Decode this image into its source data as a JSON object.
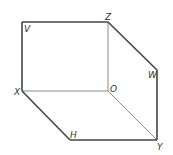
{
  "diagram": {
    "type": "cuboid-projection",
    "colors": {
      "edge": "#333333",
      "hidden_edge": "#999999",
      "label": "#333333",
      "background": "#ffffff"
    },
    "points": {
      "V": {
        "x": 22,
        "y": 22
      },
      "Z": {
        "x": 108,
        "y": 22
      },
      "W": {
        "x": 157,
        "y": 70
      },
      "X": {
        "x": 22,
        "y": 91
      },
      "O": {
        "x": 108,
        "y": 91
      },
      "H": {
        "x": 70,
        "y": 140
      },
      "Y": {
        "x": 157,
        "y": 140
      }
    },
    "labels": {
      "V": "V",
      "Z": "Z",
      "W": "W",
      "X": "X",
      "O": "O",
      "H": "H",
      "Y": "Y"
    },
    "edges": [
      {
        "from": "V",
        "to": "Z",
        "style": "solid"
      },
      {
        "from": "V",
        "to": "X",
        "style": "solid"
      },
      {
        "from": "Z",
        "to": "W",
        "style": "solid"
      },
      {
        "from": "W",
        "to": "Y",
        "style": "solid"
      },
      {
        "from": "X",
        "to": "H",
        "style": "solid"
      },
      {
        "from": "H",
        "to": "Y",
        "style": "solid"
      },
      {
        "from": "X",
        "to": "O",
        "style": "thin"
      },
      {
        "from": "Z",
        "to": "O",
        "style": "thin"
      },
      {
        "from": "O",
        "to": "Y",
        "style": "thin"
      }
    ]
  }
}
